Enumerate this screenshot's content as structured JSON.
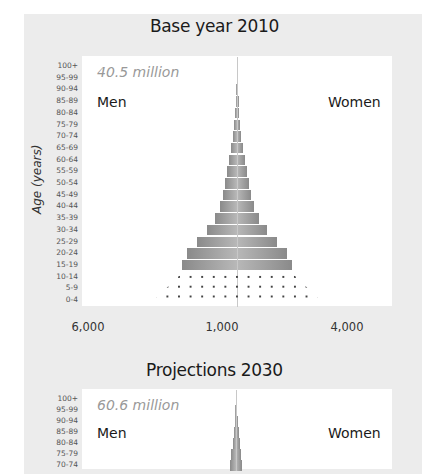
{
  "chart_data": [
    {
      "type": "bar",
      "subtype": "population-pyramid",
      "title": "Base year 2010",
      "total_label": "40.5 million",
      "left_label": "Men",
      "right_label": "Women",
      "ylabel": "Age (years)",
      "categories": [
        "100+",
        "95-99",
        "90-94",
        "85-89",
        "80-84",
        "75-79",
        "70-74",
        "65-69",
        "60-64",
        "55-59",
        "50-54",
        "45-49",
        "40-44",
        "35-39",
        "30-34",
        "25-29",
        "20-24",
        "15-19",
        "10-14",
        "5-9",
        "0-4"
      ],
      "x_tick_labels": [
        "6,000",
        "1,000",
        "4,000"
      ],
      "series": [
        {
          "name": "Men",
          "values": [
            0.5,
            0.5,
            1,
            1.5,
            2,
            3,
            4,
            6,
            8,
            10,
            12,
            14,
            17,
            22,
            30,
            40,
            50,
            55,
            65,
            76,
            88
          ]
        },
        {
          "name": "Women",
          "values": [
            0.5,
            0.5,
            1,
            1.5,
            2,
            3,
            4,
            6,
            8,
            10,
            12,
            14,
            17,
            22,
            30,
            40,
            50,
            55,
            65,
            76,
            88
          ]
        }
      ],
      "dotted_categories": [
        "10-14",
        "5-9",
        "0-4"
      ],
      "grid": false
    },
    {
      "type": "bar",
      "subtype": "population-pyramid",
      "title": "Projections 2030",
      "total_label": "60.6 million",
      "left_label": "Men",
      "right_label": "Women",
      "ylabel": "Age (years)",
      "categories": [
        "100+",
        "95-99",
        "90-94",
        "85-89",
        "80-84",
        "75-79",
        "70-74"
      ],
      "series": [
        {
          "name": "Men",
          "values": [
            0.5,
            1,
            1.5,
            2.5,
            3.5,
            5,
            6
          ]
        },
        {
          "name": "Women",
          "values": [
            0.5,
            1,
            1.5,
            2.5,
            3.5,
            5,
            6
          ]
        }
      ],
      "grid": false
    }
  ]
}
